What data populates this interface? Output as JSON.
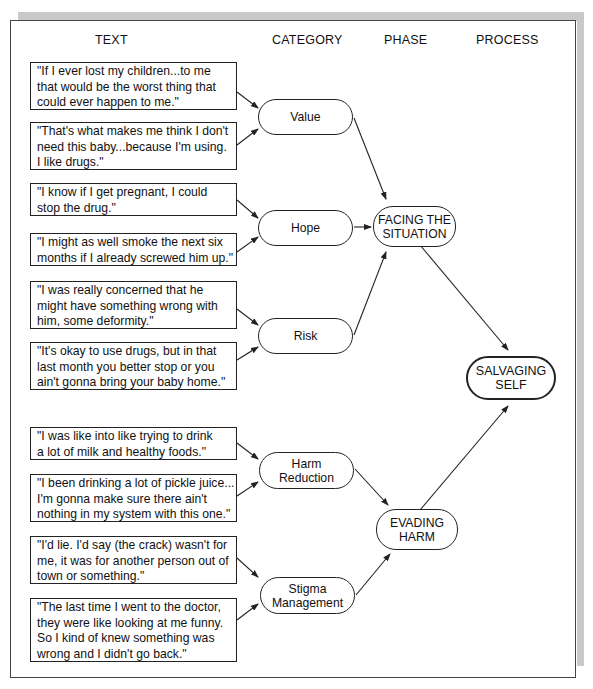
{
  "headers": {
    "text": "TEXT",
    "category": "CATEGORY",
    "phase": "PHASE",
    "process": "PROCESS"
  },
  "quotes": [
    {
      "text": "\"If I ever lost my children...to me\nthat would be the worst thing that\ncould ever happen to me.\"",
      "category": "Value"
    },
    {
      "text": "\"That's what makes me think I don't\nneed this baby...because I'm using.\nI like drugs.\"",
      "category": "Value"
    },
    {
      "text": "\"I know if I get pregnant, I could\nstop the drug.\"",
      "category": "Hope"
    },
    {
      "text": "\"I might as well smoke the next six\nmonths if I already screwed him up.\"",
      "category": "Hope"
    },
    {
      "text": "\"I was really concerned that he\nmight have something wrong with\nhim, some deformity.\"",
      "category": "Risk"
    },
    {
      "text": "\"It's okay to use drugs, but in that\nlast month you better stop or you\nain't  gonna bring your baby home.\"",
      "category": "Risk"
    },
    {
      "text": "\"I was like into like trying to drink\na lot of milk and healthy foods.\"",
      "category": "Harm Reduction"
    },
    {
      "text": "\"I been drinking a lot of pickle juice...\nI'm gonna make sure there ain't\nnothing in my system with this one.\"",
      "category": "Harm Reduction"
    },
    {
      "text": "\"I'd lie.  I'd say (the crack) wasn't for\nme, it was for another person out of\ntown or something.\"",
      "category": "Stigma Management"
    },
    {
      "text": "\"The last time I went to the doctor,\nthey were like looking at me funny.\nSo I kind of knew something was\nwrong and I didn't go back.\"",
      "category": "Stigma Management"
    }
  ],
  "categories": [
    {
      "label": "Value",
      "phase": "FACING THE SITUATION"
    },
    {
      "label": "Hope",
      "phase": "FACING THE SITUATION"
    },
    {
      "label": "Risk",
      "phase": "FACING THE SITUATION"
    },
    {
      "label": "Harm\nReduction",
      "phase": "EVADING HARM"
    },
    {
      "label": "Stigma\nManagement",
      "phase": "EVADING HARM"
    }
  ],
  "phases": [
    {
      "label": "FACING THE\nSITUATION",
      "process": "SALVAGING SELF"
    },
    {
      "label": "EVADING\nHARM",
      "process": "SALVAGING SELF"
    }
  ],
  "process": {
    "label": "SALVAGING\nSELF"
  },
  "colors": {
    "line": "#222222",
    "frame_shadow": "#c9c9c9",
    "background": "#ffffff"
  }
}
